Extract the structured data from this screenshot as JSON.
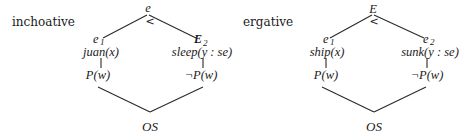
{
  "diagrams": [
    {
      "label": "inchoative",
      "top": {
        "symbol": "e",
        "relation": "<"
      },
      "left": {
        "event": "e",
        "event_sub": "1",
        "predicate": "juan(x)",
        "state": "P(w)"
      },
      "right": {
        "event": "E",
        "event_sub": "2",
        "predicate": "sleep(y : se)",
        "state": "¬P(w)"
      },
      "bottom": "OS"
    },
    {
      "label": "ergative",
      "top": {
        "symbol": "E",
        "relation": "<"
      },
      "left": {
        "event": "e",
        "event_sub": "1",
        "predicate": "ship(x)",
        "state": "P(w)"
      },
      "right": {
        "event": "e",
        "event_sub": "2",
        "predicate": "sunk(y : se)",
        "state": "¬P(w)"
      },
      "bottom": "OS"
    }
  ]
}
